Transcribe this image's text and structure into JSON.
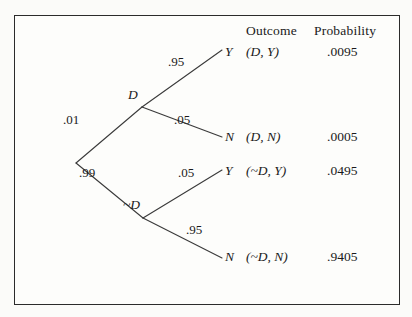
{
  "figure": {
    "type": "probability-tree",
    "columns": {
      "outcome_header": "Outcome",
      "probability_header": "Probability"
    },
    "root": {
      "label": ""
    },
    "nodes": [
      {
        "id": "D",
        "label": "D"
      },
      {
        "id": "~D",
        "label": "~D"
      }
    ],
    "edges": [
      {
        "from": "root",
        "to": "D",
        "label": ".01"
      },
      {
        "from": "root",
        "to": "~D",
        "label": ".99"
      },
      {
        "from": "D",
        "to": "leaf0",
        "label": ".95"
      },
      {
        "from": "D",
        "to": "leaf1",
        "label": ".05"
      },
      {
        "from": "~D",
        "to": "leaf2",
        "label": ".05"
      },
      {
        "from": "~D",
        "to": "leaf3",
        "label": ".95"
      }
    ],
    "leaves": [
      {
        "letter": "Y",
        "outcome": "(D, Y)",
        "probability": ".0095"
      },
      {
        "letter": "N",
        "outcome": "(D, N)",
        "probability": ".0005"
      },
      {
        "letter": "Y",
        "outcome": "(~D, Y)",
        "probability": ".0495"
      },
      {
        "letter": "N",
        "outcome": "(~D, N)",
        "probability": ".9405"
      }
    ],
    "colors": {
      "line": "#3a3a3a",
      "border": "#2b2b2b",
      "text": "#1a1a1a",
      "background": "#fdfdfb"
    }
  }
}
